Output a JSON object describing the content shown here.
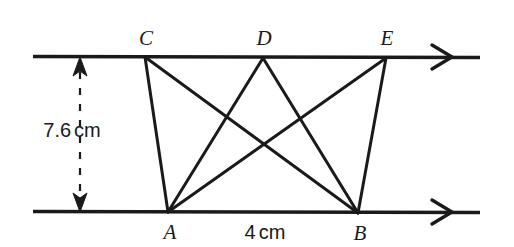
{
  "figure": {
    "background_color": "#ffffff",
    "stroke_color": "#1a1a1a",
    "width": 514,
    "height": 247
  },
  "vertices": [
    {
      "name": "C",
      "label": "C",
      "x": 145,
      "y": 57,
      "label_x": 146,
      "label_y": 38,
      "on": "top-line"
    },
    {
      "name": "D",
      "label": "D",
      "x": 263,
      "y": 58,
      "label_x": 264,
      "label_y": 38,
      "on": "top-line"
    },
    {
      "name": "E",
      "label": "E",
      "x": 386,
      "y": 58,
      "label_x": 387,
      "label_y": 38,
      "on": "top-line"
    },
    {
      "name": "A",
      "label": "A",
      "x": 168,
      "y": 212,
      "label_x": 170,
      "label_y": 232,
      "on": "bottom-line"
    },
    {
      "name": "B",
      "label": "B",
      "x": 358,
      "y": 213,
      "label_x": 360,
      "label_y": 233,
      "on": "bottom-line"
    }
  ],
  "parallel_lines": [
    {
      "name": "top-line",
      "x1": 33,
      "y1": 56,
      "x2": 480,
      "y2": 58,
      "arrow_at": 443,
      "arrow_label": "right-arrow"
    },
    {
      "name": "bottom-line",
      "x1": 33,
      "y1": 211,
      "x2": 480,
      "y2": 213,
      "arrow_at": 443,
      "arrow_label": "right-arrow"
    }
  ],
  "segments": [
    {
      "name": "segment-CA",
      "from": "C",
      "to": "A"
    },
    {
      "name": "segment-CB",
      "from": "C",
      "to": "B"
    },
    {
      "name": "segment-DA",
      "from": "D",
      "to": "A"
    },
    {
      "name": "segment-DB",
      "from": "D",
      "to": "B"
    },
    {
      "name": "segment-EA",
      "from": "E",
      "to": "A"
    },
    {
      "name": "segment-EB",
      "from": "E",
      "to": "B"
    }
  ],
  "dimensions": {
    "height": {
      "name": "height-dimension",
      "value": "7.6",
      "unit": "cm",
      "text": "7.6 cm",
      "label_x": 72,
      "label_y": 130,
      "line_x": 80,
      "line_y1": 58,
      "line_y2": 211,
      "style": "dashed-double-arrow"
    },
    "base": {
      "name": "base-dimension",
      "value": "4",
      "unit": "cm",
      "text": "4 cm",
      "label_x": 265,
      "label_y": 232,
      "between": [
        "A",
        "B"
      ]
    }
  }
}
